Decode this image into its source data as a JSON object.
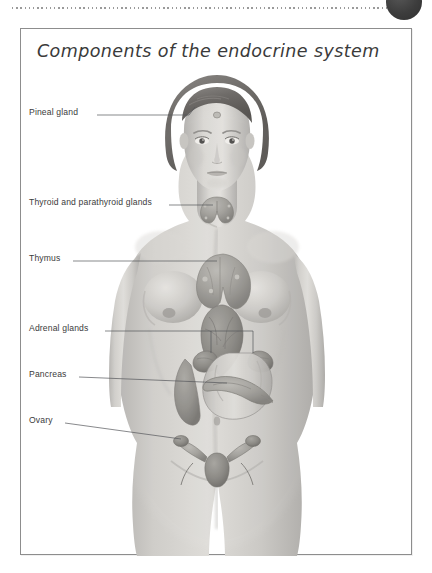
{
  "page": {
    "background_color": "#ffffff",
    "top_rule": {
      "style": "dotted",
      "color": "#9a9a9a"
    },
    "corner_marker": {
      "name": "corner-dot",
      "color": "#3d3d3d",
      "shape": "circle"
    }
  },
  "panel": {
    "title": "Components of the endocrine system",
    "border_color": "#8d8d8d",
    "background_color": "#ffffff"
  },
  "figure": {
    "rendering": "grayscale airbrush illustration",
    "skin_tone": "#c9c7c4",
    "organ_tone": "#9a9893",
    "hair_tone": "#6f6d6a"
  },
  "callouts": [
    {
      "id": "pineal-gland",
      "label": "Pineal gland",
      "label_x": 8,
      "label_y": 82,
      "leader": {
        "x1": 76,
        "y1": 86,
        "x2": 167,
        "y2": 86,
        "x3": 174,
        "y3": 74
      },
      "target": "forehead / brain midline"
    },
    {
      "id": "thyroid-parathyroid-glands",
      "label": "Thyroid and parathyroid glands",
      "label_x": 8,
      "label_y": 172,
      "leader": {
        "x1": 148,
        "y1": 176,
        "x2": 186,
        "y2": 176,
        "x3": 192,
        "y3": 176
      },
      "target": "neck, below larynx"
    },
    {
      "id": "thymus",
      "label": "Thymus",
      "label_x": 8,
      "label_y": 228,
      "leader": {
        "x1": 52,
        "y1": 232,
        "x2": 188,
        "y2": 232,
        "x3": 196,
        "y3": 234
      },
      "target": "upper mediastinum behind sternum"
    },
    {
      "id": "adrenal-glands",
      "label": "Adrenal glands",
      "label_x": 8,
      "label_y": 298,
      "leader": {
        "x1": 84,
        "y1": 302,
        "x2": 196,
        "y2": 302,
        "x3": 232,
        "y3": 302
      },
      "branches": [
        {
          "x": 196,
          "y_end": 322
        },
        {
          "x": 232,
          "y_end": 322
        }
      ],
      "target": "superior poles of both kidneys"
    },
    {
      "id": "pancreas",
      "label": "Pancreas",
      "label_x": 8,
      "label_y": 344,
      "leader": {
        "x1": 58,
        "y1": 348,
        "x2": 196,
        "y2": 348,
        "x3": 208,
        "y3": 350
      },
      "target": "behind stomach, upper abdomen"
    },
    {
      "id": "ovary",
      "label": "Ovary",
      "label_x": 8,
      "label_y": 390,
      "leader": {
        "x1": 44,
        "y1": 394,
        "x2": 184,
        "y2": 394,
        "x3": 192,
        "y3": 396
      },
      "target": "lateral to uterus, pelvic cavity"
    }
  ],
  "leader_line": {
    "color": "#55565a",
    "width": 0.7
  }
}
